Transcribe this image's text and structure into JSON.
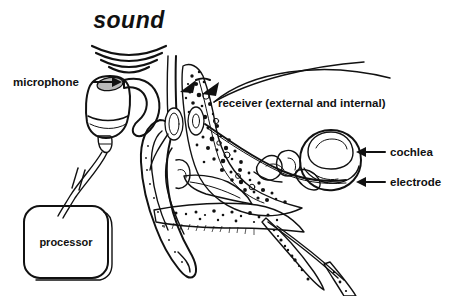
{
  "figure": {
    "background_color": "#ffffff",
    "ink_color": "#111111",
    "accent_grey": "#b9b9b9",
    "width": 459,
    "height": 296
  },
  "labels": {
    "sound": "sound",
    "microphone": "microphone",
    "receiver": "receiver (external and internal)",
    "cochlea": "cochlea",
    "electrode": "electrode",
    "processor": "processor"
  },
  "parts": [
    {
      "name": "sound",
      "label": "sound",
      "kind": "sound-waves",
      "position": "top-center"
    },
    {
      "name": "microphone",
      "label": "microphone",
      "kind": "arrow-label",
      "position": "left"
    },
    {
      "name": "receiver",
      "label": "receiver (external and internal)",
      "kind": "double-curve-label",
      "position": "right-upper"
    },
    {
      "name": "cochlea",
      "label": "cochlea",
      "kind": "arrow-label",
      "position": "right"
    },
    {
      "name": "electrode",
      "label": "electrode",
      "kind": "arrow-label",
      "position": "right-lower"
    },
    {
      "name": "processor",
      "label": "processor",
      "kind": "boxed-label",
      "position": "bottom-left"
    }
  ],
  "annotations": {
    "sound_wave_arc_count": 4,
    "receiver_pointer_count": 2
  }
}
